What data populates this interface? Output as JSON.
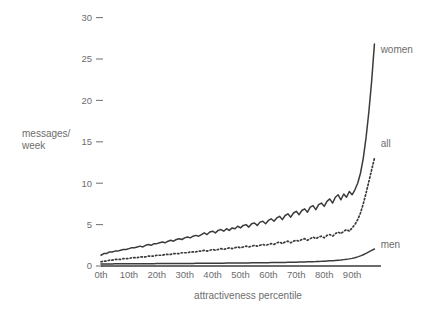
{
  "chart_data": {
    "type": "line",
    "title": "",
    "xlabel": "attractiveness percentile",
    "ylabel": "messages/\nweek",
    "ylabel_line1": "messages/",
    "ylabel_line2": "week",
    "xlim": [
      0,
      99
    ],
    "ylim": [
      0,
      31
    ],
    "grid": false,
    "legend_position": "right-inline",
    "y_ticks": [
      0,
      5,
      10,
      15,
      20,
      25,
      30
    ],
    "y_tick_labels": [
      "0",
      "5",
      "10",
      "15",
      "20",
      "25",
      "30"
    ],
    "x_ticks": [
      0,
      10,
      20,
      30,
      40,
      50,
      60,
      70,
      80,
      90
    ],
    "x_tick_labels": [
      "0th",
      "10th",
      "20th",
      "30th",
      "40th",
      "50th",
      "60th",
      "70th",
      "80th",
      "90th"
    ],
    "line_color": "#3b3b3b",
    "text_color": "#6d6d6d",
    "background_color": "#ffffff",
    "series": [
      {
        "name": "women",
        "label": "women",
        "style": "solid",
        "label_x": 97,
        "label_y": 26.2,
        "x": [
          0,
          1,
          2,
          3,
          4,
          5,
          6,
          7,
          8,
          9,
          10,
          11,
          12,
          13,
          14,
          15,
          16,
          17,
          18,
          19,
          20,
          21,
          22,
          23,
          24,
          25,
          26,
          27,
          28,
          29,
          30,
          31,
          32,
          33,
          34,
          35,
          36,
          37,
          38,
          39,
          40,
          41,
          42,
          43,
          44,
          45,
          46,
          47,
          48,
          49,
          50,
          51,
          52,
          53,
          54,
          55,
          56,
          57,
          58,
          59,
          60,
          61,
          62,
          63,
          64,
          65,
          66,
          67,
          68,
          69,
          70,
          71,
          72,
          73,
          74,
          75,
          76,
          77,
          78,
          79,
          80,
          81,
          82,
          83,
          84,
          85,
          86,
          87,
          88,
          89,
          90,
          91,
          92,
          93,
          94,
          95,
          96,
          97,
          98
        ],
        "values": [
          1.3,
          1.5,
          1.5,
          1.7,
          1.7,
          1.8,
          1.8,
          1.9,
          2.0,
          2.0,
          2.1,
          2.2,
          2.2,
          2.3,
          2.4,
          2.3,
          2.5,
          2.6,
          2.5,
          2.7,
          2.7,
          2.8,
          2.9,
          2.8,
          3.0,
          3.1,
          3.0,
          3.2,
          3.3,
          3.2,
          3.4,
          3.5,
          3.4,
          3.6,
          3.7,
          3.6,
          3.8,
          4.0,
          3.8,
          4.1,
          4.2,
          4.0,
          4.3,
          4.4,
          4.2,
          4.5,
          4.3,
          4.6,
          4.5,
          4.8,
          4.6,
          4.9,
          5.0,
          4.7,
          5.1,
          5.2,
          4.9,
          5.3,
          5.4,
          5.1,
          5.5,
          5.7,
          5.4,
          5.8,
          6.0,
          5.6,
          6.1,
          6.3,
          5.9,
          6.4,
          6.6,
          6.2,
          6.7,
          6.9,
          6.5,
          7.1,
          7.3,
          6.8,
          7.4,
          7.6,
          7.2,
          7.8,
          8.1,
          7.6,
          8.3,
          8.6,
          8.0,
          8.7,
          8.3,
          9.0,
          8.6,
          9.2,
          10.0,
          11.2,
          13.0,
          15.5,
          18.6,
          22.3,
          26.8
        ]
      },
      {
        "name": "all",
        "label": "all",
        "style": "dotted",
        "label_x": 97,
        "label_y": 14.8,
        "x": [
          0,
          1,
          2,
          3,
          4,
          5,
          6,
          7,
          8,
          9,
          10,
          11,
          12,
          13,
          14,
          15,
          16,
          17,
          18,
          19,
          20,
          21,
          22,
          23,
          24,
          25,
          26,
          27,
          28,
          29,
          30,
          31,
          32,
          33,
          34,
          35,
          36,
          37,
          38,
          39,
          40,
          41,
          42,
          43,
          44,
          45,
          46,
          47,
          48,
          49,
          50,
          51,
          52,
          53,
          54,
          55,
          56,
          57,
          58,
          59,
          60,
          61,
          62,
          63,
          64,
          65,
          66,
          67,
          68,
          69,
          70,
          71,
          72,
          73,
          74,
          75,
          76,
          77,
          78,
          79,
          80,
          81,
          82,
          83,
          84,
          85,
          86,
          87,
          88,
          89,
          90,
          91,
          92,
          93,
          94,
          95,
          96,
          97,
          98
        ],
        "values": [
          0.5,
          0.6,
          0.6,
          0.7,
          0.7,
          0.8,
          0.8,
          0.8,
          0.9,
          0.9,
          0.9,
          1.0,
          1.0,
          1.0,
          1.1,
          1.1,
          1.1,
          1.2,
          1.2,
          1.2,
          1.3,
          1.3,
          1.3,
          1.4,
          1.4,
          1.4,
          1.5,
          1.5,
          1.5,
          1.6,
          1.6,
          1.6,
          1.7,
          1.7,
          1.7,
          1.8,
          1.8,
          1.9,
          1.8,
          1.9,
          2.0,
          1.9,
          2.0,
          2.1,
          2.0,
          2.1,
          2.2,
          2.1,
          2.2,
          2.3,
          2.2,
          2.3,
          2.4,
          2.3,
          2.4,
          2.5,
          2.4,
          2.5,
          2.6,
          2.5,
          2.6,
          2.7,
          2.6,
          2.8,
          2.9,
          2.7,
          2.9,
          3.0,
          2.8,
          3.0,
          3.1,
          3.0,
          3.2,
          3.3,
          3.1,
          3.3,
          3.5,
          3.3,
          3.5,
          3.6,
          3.4,
          3.7,
          3.8,
          3.6,
          3.9,
          4.1,
          3.9,
          4.2,
          4.4,
          4.2,
          4.6,
          5.0,
          5.6,
          6.4,
          7.5,
          8.8,
          10.2,
          11.6,
          13.0
        ]
      },
      {
        "name": "men",
        "label": "men",
        "style": "solid",
        "label_x": 97,
        "label_y": 2.6,
        "x": [
          0,
          1,
          2,
          3,
          4,
          5,
          6,
          7,
          8,
          9,
          10,
          11,
          12,
          13,
          14,
          15,
          16,
          17,
          18,
          19,
          20,
          21,
          22,
          23,
          24,
          25,
          26,
          27,
          28,
          29,
          30,
          31,
          32,
          33,
          34,
          35,
          36,
          37,
          38,
          39,
          40,
          41,
          42,
          43,
          44,
          45,
          46,
          47,
          48,
          49,
          50,
          51,
          52,
          53,
          54,
          55,
          56,
          57,
          58,
          59,
          60,
          61,
          62,
          63,
          64,
          65,
          66,
          67,
          68,
          69,
          70,
          71,
          72,
          73,
          74,
          75,
          76,
          77,
          78,
          79,
          80,
          81,
          82,
          83,
          84,
          85,
          86,
          87,
          88,
          89,
          90,
          91,
          92,
          93,
          94,
          95,
          96,
          97,
          98
        ],
        "values": [
          0.25,
          0.25,
          0.25,
          0.25,
          0.25,
          0.26,
          0.26,
          0.26,
          0.26,
          0.26,
          0.27,
          0.27,
          0.27,
          0.27,
          0.27,
          0.28,
          0.28,
          0.28,
          0.28,
          0.28,
          0.29,
          0.29,
          0.29,
          0.29,
          0.29,
          0.3,
          0.3,
          0.3,
          0.3,
          0.3,
          0.31,
          0.31,
          0.31,
          0.31,
          0.32,
          0.32,
          0.32,
          0.32,
          0.33,
          0.33,
          0.33,
          0.33,
          0.34,
          0.34,
          0.34,
          0.35,
          0.35,
          0.35,
          0.36,
          0.36,
          0.36,
          0.37,
          0.37,
          0.37,
          0.38,
          0.38,
          0.38,
          0.39,
          0.39,
          0.4,
          0.4,
          0.41,
          0.41,
          0.42,
          0.42,
          0.43,
          0.43,
          0.44,
          0.45,
          0.45,
          0.46,
          0.47,
          0.48,
          0.49,
          0.5,
          0.51,
          0.52,
          0.53,
          0.55,
          0.56,
          0.58,
          0.6,
          0.62,
          0.64,
          0.67,
          0.7,
          0.73,
          0.77,
          0.81,
          0.86,
          0.92,
          1.0,
          1.1,
          1.22,
          1.36,
          1.52,
          1.7,
          1.88,
          2.05
        ]
      }
    ]
  }
}
